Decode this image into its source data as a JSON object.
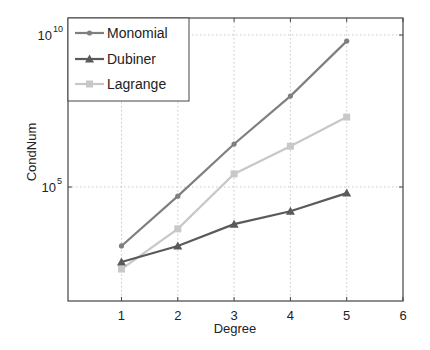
{
  "chart_data": {
    "type": "line",
    "title": "",
    "xlabel": "Degree",
    "ylabel": "CondNum",
    "yscale": "log",
    "x": [
      1,
      2,
      3,
      4,
      5
    ],
    "xticks": [
      1,
      2,
      3,
      4,
      5,
      6
    ],
    "xlim": [
      0.05,
      6
    ],
    "yticks": [
      {
        "exp": 5,
        "label": "10",
        "sup": "5"
      },
      {
        "exp": 10,
        "label": "10",
        "sup": "10"
      }
    ],
    "ylim_log10": [
      1.25,
      10.56
    ],
    "grid": true,
    "legend_position": "upper left",
    "series": [
      {
        "name": "Monomial",
        "marker": "dot",
        "color": "#7f7f7f",
        "values": [
          1150,
          50000,
          2600000,
          98000000,
          6300000000
        ]
      },
      {
        "name": "Dubiner",
        "marker": "triangle",
        "color": "#5a5a5a",
        "values": [
          340,
          1150,
          6000,
          16000,
          63000
        ]
      },
      {
        "name": "Lagrange",
        "marker": "square",
        "color": "#c8c8c8",
        "values": [
          200,
          4200,
          270000,
          2200000,
          20000000
        ]
      }
    ]
  }
}
